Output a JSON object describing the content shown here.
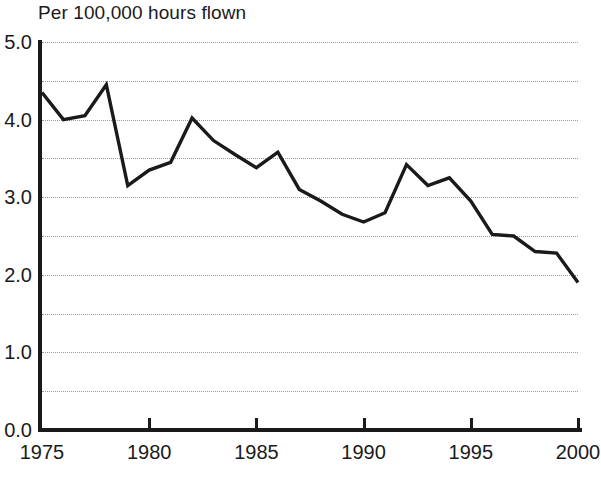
{
  "chart_data": {
    "type": "line",
    "title": "Per 100,000 hours flown",
    "subtitle": "",
    "xlabel": "",
    "ylabel": "",
    "xlim": [
      1975,
      2000
    ],
    "ylim": [
      0.0,
      5.0
    ],
    "grid": true,
    "grid_style": "dotted horizontal",
    "grid_interval": 0.5,
    "legend": "none",
    "line_color": "#1a1a1a",
    "x": [
      1975,
      1976,
      1977,
      1978,
      1979,
      1980,
      1981,
      1982,
      1983,
      1984,
      1985,
      1986,
      1987,
      1988,
      1989,
      1990,
      1991,
      1992,
      1993,
      1994,
      1995,
      1996,
      1997,
      1998,
      1999,
      2000
    ],
    "values": [
      4.35,
      4.0,
      4.05,
      4.45,
      3.15,
      3.35,
      3.45,
      4.02,
      3.73,
      3.55,
      3.38,
      3.58,
      3.1,
      2.95,
      2.78,
      2.68,
      2.8,
      3.42,
      3.15,
      3.25,
      2.95,
      2.52,
      2.5,
      2.3,
      2.28,
      1.9
    ],
    "categories": [
      "1975",
      "1976",
      "1977",
      "1978",
      "1979",
      "1980",
      "1981",
      "1982",
      "1983",
      "1984",
      "1985",
      "1986",
      "1987",
      "1988",
      "1989",
      "1990",
      "1991",
      "1992",
      "1993",
      "1994",
      "1995",
      "1996",
      "1997",
      "1998",
      "1999",
      "2000"
    ],
    "y_ticks": [
      {
        "value": 5.0,
        "label": "5.0"
      },
      {
        "value": 4.0,
        "label": "4.0"
      },
      {
        "value": 3.0,
        "label": "3.0"
      },
      {
        "value": 2.0,
        "label": "2.0"
      },
      {
        "value": 1.0,
        "label": "1.0"
      },
      {
        "value": 0.0,
        "label": "0.0"
      }
    ],
    "y_gridline_values": [
      5.0,
      4.5,
      4.0,
      3.5,
      3.0,
      2.5,
      2.0,
      1.5,
      1.0,
      0.5
    ],
    "x_ticks": [
      {
        "value": 1975,
        "label": "1975"
      },
      {
        "value": 1980,
        "label": "1980"
      },
      {
        "value": 1985,
        "label": "1985"
      },
      {
        "value": 1990,
        "label": "1990"
      },
      {
        "value": 1995,
        "label": "1995"
      },
      {
        "value": 2000,
        "label": "2000"
      }
    ]
  }
}
